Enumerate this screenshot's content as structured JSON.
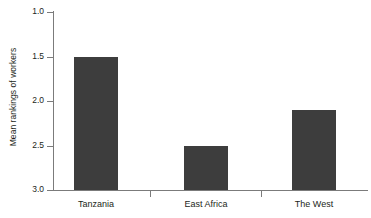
{
  "chart_data": {
    "type": "bar",
    "title": "",
    "xlabel": "",
    "ylabel": "Mean rankings of workers",
    "categories": [
      "Tanzania",
      "East Africa",
      "The West"
    ],
    "values": [
      1.5,
      2.5,
      2.1
    ],
    "series": [
      {
        "name": "Mean rankings of workers",
        "values": [
          1.5,
          2.5,
          2.1
        ]
      }
    ],
    "ylim": [
      1.0,
      3.0
    ],
    "y_inverted": true,
    "y_ticks": [
      "1.0",
      "1.5",
      "2.0",
      "2.5",
      "3.0"
    ],
    "y_tick_values": [
      1.0,
      1.5,
      2.0,
      2.5,
      3.0
    ],
    "grid": false,
    "legend": false,
    "legend_position": "none",
    "bar_color": "#3d3d3d",
    "axis_color": "#7b7b7b",
    "background_color": "#ffffff"
  },
  "axes": {
    "y_title": "Mean rankings of workers",
    "tick_labels": {
      "t0": "1.0",
      "t1": "1.5",
      "t2": "2.0",
      "t3": "2.5",
      "t4": "3.0"
    },
    "category_labels": {
      "c0": "Tanzania",
      "c1": "East Africa",
      "c2": "The West"
    }
  }
}
